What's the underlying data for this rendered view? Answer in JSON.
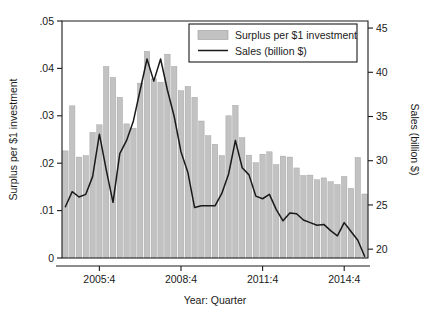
{
  "chart_data": {
    "type": "bar",
    "title": "",
    "xlabel": "Year: Quarter",
    "ylabel": "Surplus per $1 investment",
    "y2label": "Sales (billion $)",
    "ylim": [
      0,
      0.05
    ],
    "y2lim": [
      19,
      45.8
    ],
    "ytick_labels": [
      "0",
      ".01",
      ".02",
      ".03",
      ".04",
      ".05"
    ],
    "ytick_values": [
      0,
      0.01,
      0.02,
      0.03,
      0.04,
      0.05
    ],
    "y2tick_labels": [
      "20",
      "25",
      "30",
      "35",
      "40",
      "45"
    ],
    "y2tick_values": [
      20,
      25,
      30,
      35,
      40,
      45
    ],
    "xtick_labels": [
      "2005:4",
      "2008:4",
      "2011:4",
      "2014:4"
    ],
    "xtick_categories": [
      "2005:4",
      "2008:4",
      "2011:4",
      "2014:4"
    ],
    "grid": false,
    "legend_position": "top-right",
    "bar_color": "#c2c2c2",
    "bar_edge_color": "#9c9c9c",
    "line_color": "#1a1a1a",
    "legend": [
      {
        "label": "Surplus per $1 investment",
        "marker": "bar"
      },
      {
        "label": "Sales (billion $)",
        "marker": "line"
      }
    ],
    "categories": [
      "2004:3",
      "2004:4",
      "2005:1",
      "2005:2",
      "2005:3",
      "2005:4",
      "2006:1",
      "2006:2",
      "2006:3",
      "2006:4",
      "2007:1",
      "2007:2",
      "2007:3",
      "2007:4",
      "2008:1",
      "2008:2",
      "2008:3",
      "2008:4",
      "2009:1",
      "2009:2",
      "2009:3",
      "2009:4",
      "2010:1",
      "2010:2",
      "2010:3",
      "2010:4",
      "2011:1",
      "2011:2",
      "2011:3",
      "2011:4",
      "2012:1",
      "2012:2",
      "2012:3",
      "2012:4",
      "2013:1",
      "2013:2",
      "2013:3",
      "2013:4",
      "2014:1",
      "2014:2",
      "2014:3",
      "2014:4",
      "2015:1",
      "2015:2",
      "2015:3"
    ],
    "series": [
      {
        "name": "Surplus per $1 investment",
        "type": "bar",
        "axis": "left",
        "values": [
          0.0226,
          0.0321,
          0.0213,
          0.0216,
          0.0265,
          0.0281,
          0.0404,
          0.0381,
          0.0339,
          0.0283,
          0.0274,
          0.0369,
          0.0436,
          0.0378,
          0.0371,
          0.043,
          0.0404,
          0.0353,
          0.0362,
          0.0339,
          0.0289,
          0.0258,
          0.024,
          0.0216,
          0.03,
          0.0322,
          0.0254,
          0.0217,
          0.0201,
          0.0219,
          0.0224,
          0.0197,
          0.0215,
          0.0213,
          0.019,
          0.0174,
          0.0175,
          0.0165,
          0.0169,
          0.0161,
          0.0155,
          0.0172,
          0.0147,
          0.0212,
          0.0135
        ]
      },
      {
        "name": "Sales (billion $)",
        "type": "line",
        "axis": "right",
        "values": [
          24.8,
          26.5,
          25.9,
          26.2,
          28.2,
          33.0,
          29.0,
          25.3,
          30.8,
          32.3,
          34.5,
          38.0,
          41.5,
          39.0,
          41.5,
          38.0,
          35.0,
          31.0,
          28.7,
          24.7,
          24.9,
          24.9,
          24.9,
          26.3,
          28.5,
          32.3,
          29.2,
          28.4,
          26.0,
          25.7,
          26.2,
          24.5,
          23.2,
          24.1,
          24.0,
          23.3,
          23.0,
          22.7,
          22.8,
          22.1,
          21.5,
          23.0,
          22.0,
          21.0,
          19.2
        ]
      }
    ]
  }
}
